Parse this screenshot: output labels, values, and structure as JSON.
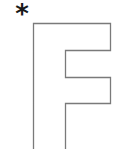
{
  "worksheet": {
    "start_marker": "*",
    "letter": "F",
    "style": "outline",
    "stroke_color": "#7a7a7a",
    "marker_color": "#1a1a1a",
    "background_color": "#ffffff"
  }
}
